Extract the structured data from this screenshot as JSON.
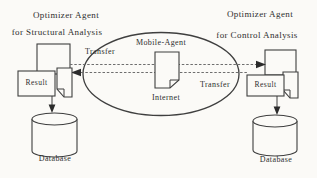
{
  "left_agent": {
    "title_line1": "Optimizer Agent",
    "title_line2": "for Structural Analysis",
    "result_label": "Result",
    "database_label": "Database",
    "transfer_label": "Transfer"
  },
  "right_agent": {
    "title_line1": "Optimizer Agent",
    "title_line2": "for Control Analysis",
    "result_label": "Result",
    "database_label": "Database",
    "transfer_label": "Transfer"
  },
  "center": {
    "mobile_agent_label": "Mobile-Agent",
    "internet_label": "Internet"
  },
  "colors": {
    "background": "#fbfaf7",
    "shape_stroke": "#3f3f3f",
    "wire_stroke": "#6e6e6e",
    "text": "#2e2e2e"
  }
}
